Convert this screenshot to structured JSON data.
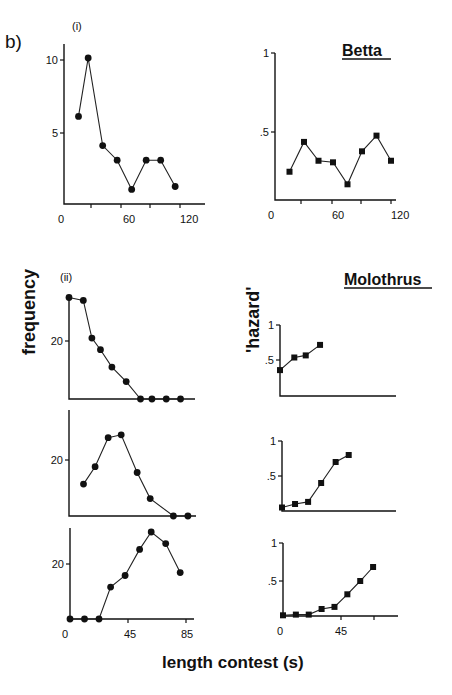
{
  "figure": {
    "panel_label": "b)",
    "sub_i": "(i)",
    "sub_ii": "(ii)",
    "species_betta": "Betta",
    "species_molothrus": "Molothrus",
    "ylabel_left": "frequency",
    "ylabel_right": "'hazard'",
    "xlabel": "length contest (s)"
  },
  "chart_data": [
    {
      "id": "betta-frequency",
      "type": "line",
      "title": "(i)",
      "xlabel": "length contest (s)",
      "ylabel": "frequency",
      "x_ticks": [
        "0",
        "60",
        "120"
      ],
      "y_ticks": [
        "5",
        "10"
      ],
      "x": [
        15,
        25,
        40,
        55,
        70,
        85,
        100,
        115
      ],
      "values": [
        6,
        10,
        4,
        3,
        1,
        3,
        3,
        1.2
      ],
      "marker": "circle",
      "xlim": [
        0,
        135
      ],
      "ylim": [
        0,
        11
      ]
    },
    {
      "id": "betta-hazard",
      "type": "line",
      "title": "Betta",
      "xlabel": "length contest (s)",
      "ylabel": "'hazard'",
      "x_ticks": [
        "0",
        "60",
        "120"
      ],
      "y_ticks": [
        ".5",
        "1"
      ],
      "x": [
        15,
        30,
        45,
        60,
        75,
        90,
        105,
        120
      ],
      "values": [
        0.18,
        0.37,
        0.25,
        0.24,
        0.1,
        0.31,
        0.41,
        0.25
      ],
      "marker": "square",
      "xlim": [
        0,
        130
      ],
      "ylim": [
        0,
        1
      ]
    },
    {
      "id": "molothrus-frequency-1",
      "type": "line",
      "title": "(ii)",
      "ylabel": "frequency",
      "y_ticks": [
        "20"
      ],
      "x": [
        0,
        10,
        16,
        22,
        30,
        40,
        50,
        58,
        68,
        78
      ],
      "values": [
        35,
        34,
        21,
        17,
        11,
        6,
        0,
        0,
        0,
        0
      ],
      "marker": "circle",
      "xlim": [
        0,
        85
      ],
      "ylim": [
        0,
        36
      ]
    },
    {
      "id": "molothrus-hazard-1",
      "type": "line",
      "title": "Molothrus",
      "ylabel": "'hazard'",
      "y_ticks": [
        ".5",
        "1"
      ],
      "x": [
        0,
        10,
        18,
        28
      ],
      "values": [
        0.37,
        0.55,
        0.58,
        0.73
      ],
      "marker": "square",
      "xlim": [
        0,
        80
      ],
      "ylim": [
        0,
        1
      ]
    },
    {
      "id": "molothrus-frequency-2",
      "type": "line",
      "ylabel": "frequency",
      "y_ticks": [
        "20"
      ],
      "x": [
        10,
        18,
        27,
        36,
        47,
        56,
        72,
        82
      ],
      "values": [
        11,
        17,
        27,
        28,
        15,
        6,
        0,
        0
      ],
      "marker": "circle",
      "xlim": [
        0,
        85
      ],
      "ylim": [
        0,
        32
      ]
    },
    {
      "id": "molothrus-hazard-2",
      "type": "line",
      "ylabel": "'hazard'",
      "y_ticks": [
        ".5",
        "1"
      ],
      "x": [
        0,
        9,
        18,
        27,
        37,
        46
      ],
      "values": [
        0.05,
        0.1,
        0.13,
        0.4,
        0.7,
        0.8
      ],
      "marker": "square",
      "xlim": [
        0,
        80
      ],
      "ylim": [
        0,
        1
      ]
    },
    {
      "id": "molothrus-frequency-3",
      "type": "line",
      "xlabel": "length contest (s)",
      "ylabel": "frequency",
      "x_ticks": [
        "0",
        "45",
        "85"
      ],
      "y_ticks": [
        "20"
      ],
      "x": [
        0,
        10,
        20,
        28,
        38,
        48,
        56,
        66,
        76
      ],
      "values": [
        0,
        0,
        0,
        11,
        15,
        24,
        30,
        26,
        16
      ],
      "marker": "circle",
      "xlim": [
        0,
        85
      ],
      "ylim": [
        0,
        32
      ]
    },
    {
      "id": "molothrus-hazard-3",
      "type": "line",
      "xlabel": "length contest (s)",
      "ylabel": "'hazard'",
      "x_ticks": [
        "0",
        "45"
      ],
      "y_ticks": [
        ".5",
        "1"
      ],
      "x": [
        0,
        9,
        18,
        27,
        36,
        45,
        54,
        63
      ],
      "values": [
        0.01,
        0.02,
        0.02,
        0.1,
        0.13,
        0.31,
        0.5,
        0.7
      ],
      "marker": "square",
      "xlim": [
        0,
        75
      ],
      "ylim": [
        0,
        1
      ]
    }
  ]
}
